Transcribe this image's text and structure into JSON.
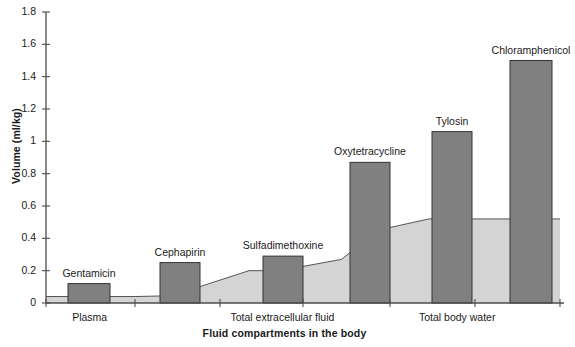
{
  "chart_data": {
    "type": "bar",
    "title": "",
    "xlabel": "Fluid compartments in the body",
    "ylabel": "Volume (ml/kg)",
    "ylim": [
      0,
      1.8
    ],
    "ytick_labels": [
      "0",
      "0.2",
      "0.4",
      "0.6",
      "0.8",
      "1",
      "1.2",
      "1.4",
      "1.6",
      "1.8"
    ],
    "ytick_values": [
      0,
      0.2,
      0.4,
      0.6,
      0.8,
      1.0,
      1.2,
      1.4,
      1.6,
      1.8
    ],
    "grid": false,
    "legend": "none",
    "categories": [
      "Gentamicin",
      "Cephapirin",
      "Sulfadimethoxine",
      "Oxytetracycline",
      "Tylosin",
      "Chloramphenicol"
    ],
    "values": [
      0.12,
      0.25,
      0.29,
      0.87,
      1.06,
      1.5
    ],
    "xtick_labels": [
      "Plasma",
      "Total extracellular fluid",
      "Total body water"
    ],
    "xtick_label_positions": [
      0.085,
      0.46,
      0.8
    ],
    "series": [
      {
        "name": "Volume of distribution",
        "type": "bar",
        "color": "#808080",
        "edge_color": "#333333",
        "values": [
          0.12,
          0.25,
          0.29,
          0.87,
          1.06,
          1.5
        ]
      },
      {
        "name": "Fluid compartment volume",
        "type": "area",
        "color": "#d4d4d4",
        "edge_color": "#555555",
        "x": [
          0.0,
          0.175,
          0.245,
          0.395,
          0.455,
          0.575,
          0.645,
          0.745,
          0.815,
          1.0
        ],
        "y": [
          0.04,
          0.04,
          0.045,
          0.2,
          0.2,
          0.27,
          0.45,
          0.52,
          0.52,
          0.52
        ]
      }
    ]
  },
  "axis": {
    "y_axis_name": "Volume (ml/kg)",
    "x_axis_name": "Fluid compartments in the body"
  },
  "bar_labels": [
    {
      "text": "Gentamicin",
      "value": 0.12
    },
    {
      "text": "Cephapirin",
      "value": 0.25
    },
    {
      "text": "Sulfadimethoxine",
      "value": 0.29
    },
    {
      "text": "Oxytetracycline",
      "value": 0.87
    },
    {
      "text": "Tylosin",
      "value": 1.06
    },
    {
      "text": "Chloramphenicol",
      "value": 1.5
    }
  ],
  "colors": {
    "bar_fill": "#808080",
    "bar_edge": "#333333",
    "area_fill": "#d4d4d4",
    "area_edge": "#555555",
    "axis": "#4d4d4d",
    "text": "#1a1a1a",
    "background": "#ffffff"
  }
}
